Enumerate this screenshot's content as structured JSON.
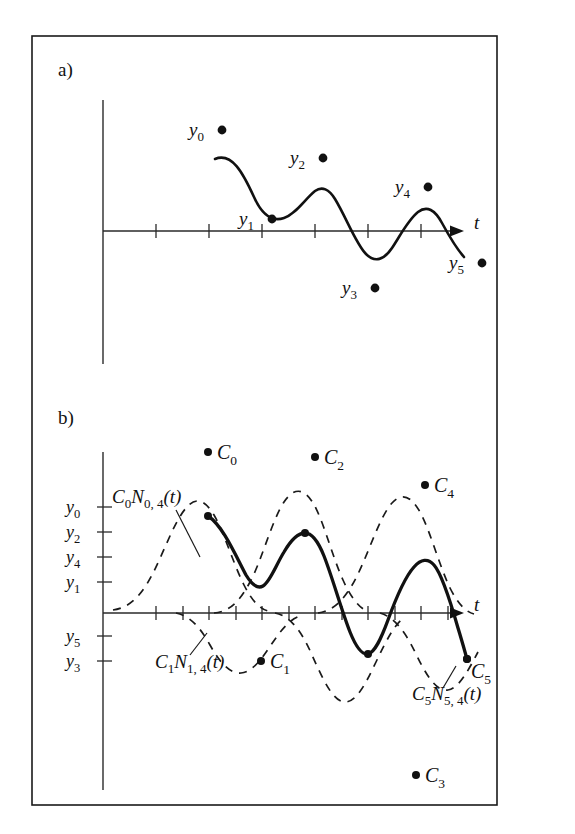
{
  "figure": {
    "background_color": "#ffffff",
    "ink_color": "#111111",
    "frame": {
      "x": 32,
      "y": 36,
      "width": 465,
      "height": 769
    }
  },
  "panel_a": {
    "label": "a)",
    "axis_label_t": "t",
    "data_point_labels": [
      "y",
      "y",
      "y",
      "y",
      "y",
      "y"
    ],
    "data_point_subscripts": [
      "0",
      "1",
      "2",
      "3",
      "4",
      "5"
    ],
    "points": [
      {
        "label": "y",
        "sub": "0",
        "dot_x": 222,
        "dot_y": 130,
        "text_x": 189,
        "text_y": 136,
        "dot_side": "right"
      },
      {
        "label": "y",
        "sub": "1",
        "dot_x": 272,
        "dot_y": 219,
        "text_x": 239,
        "text_y": 225,
        "dot_side": "right"
      },
      {
        "label": "y",
        "sub": "2",
        "dot_x": 323,
        "dot_y": 158,
        "text_x": 290,
        "text_y": 164,
        "dot_side": "right"
      },
      {
        "label": "y",
        "sub": "3",
        "dot_x": 375,
        "dot_y": 288,
        "text_x": 342,
        "text_y": 294,
        "dot_side": "right"
      },
      {
        "label": "y",
        "sub": "4",
        "dot_x": 428,
        "dot_y": 187,
        "text_x": 395,
        "text_y": 193,
        "dot_side": "right"
      },
      {
        "label": "y",
        "sub": "5",
        "dot_x": 482,
        "dot_y": 263,
        "text_x": 449,
        "text_y": 269,
        "dot_side": "right"
      }
    ],
    "axis": {
      "x_origin": 103,
      "y_baseline": 231,
      "x_end": 455,
      "y_top": 100,
      "y_bottom": 364
    },
    "ticks_x": [
      156,
      209,
      262,
      315,
      368,
      421
    ],
    "curve_d": "M 215 159 C 232 152 243 173 254 197 C 262 215 272 222 284 218 C 296 214 305 199 315 191 C 322 186 329 189 335 199 C 346 217 356 244 366 254 C 375 263 384 260 392 248 C 400 236 408 220 418 212 C 427 205 435 210 442 223 C 448 234 456 248 464 257"
  },
  "panel_b": {
    "label": "b)",
    "axis_label_t": "t",
    "y_axis_labels": [
      {
        "label": "y",
        "sub": "0",
        "x": 88,
        "y": 513,
        "tick_y": 507
      },
      {
        "label": "y",
        "sub": "2",
        "x": 88,
        "y": 538,
        "tick_y": 532
      },
      {
        "label": "y",
        "sub": "4",
        "x": 88,
        "y": 563,
        "tick_y": 557
      },
      {
        "label": "y",
        "sub": "1",
        "x": 88,
        "y": 588,
        "tick_y": 582
      },
      {
        "label": "y",
        "sub": "5",
        "x": 88,
        "y": 642,
        "tick_y": 636
      },
      {
        "label": "y",
        "sub": "3",
        "x": 88,
        "y": 667,
        "tick_y": 661
      }
    ],
    "control_points": [
      {
        "label": "C",
        "sub": "0",
        "dot_x": 208,
        "dot_y": 452,
        "text_x": 216,
        "text_y": 459
      },
      {
        "label": "C",
        "sub": "2",
        "dot_x": 315,
        "dot_y": 457,
        "text_x": 323,
        "text_y": 464
      },
      {
        "label": "C",
        "sub": "4",
        "dot_x": 425,
        "dot_y": 485,
        "text_x": 433,
        "text_y": 492
      },
      {
        "label": "C",
        "sub": "1",
        "dot_x": 261,
        "dot_y": 661,
        "text_x": 269,
        "text_y": 668
      },
      {
        "label": "C",
        "sub": "5",
        "dot_x": 467,
        "dot_y": 659,
        "text_x": 473,
        "text_y": 672
      },
      {
        "label": "C",
        "sub": "3",
        "dot_x": 416,
        "dot_y": 775,
        "text_x": 424,
        "text_y": 782
      }
    ],
    "basis_labels": [
      {
        "name": "C0N04",
        "parts": {
          "c": "C",
          "csub": "0",
          "n": "N",
          "nsub": "0, 4",
          "arg": "(t)"
        },
        "text_x": 112,
        "text_y": 503,
        "leader": {
          "x1": 176,
          "y1": 510,
          "x2": 200,
          "y2": 555
        }
      },
      {
        "name": "C1N14",
        "parts": {
          "c": "C",
          "csub": "1",
          "n": "N",
          "nsub": "1, 4",
          "arg": "(t)"
        },
        "text_x": 155,
        "text_y": 668,
        "leader": {
          "x1": 198,
          "y1": 660,
          "x2": 212,
          "y2": 637
        }
      },
      {
        "name": "C5N54",
        "parts": {
          "c": "C",
          "csub": "5",
          "n": "N",
          "nsub": "5, 4",
          "arg": "(t)"
        },
        "text_x": 412,
        "text_y": 700,
        "leader": {
          "x1": 443,
          "y1": 690,
          "x2": 458,
          "y2": 666
        }
      }
    ],
    "axis": {
      "x_origin": 103,
      "y_baseline": 613,
      "x_end": 455,
      "y_top": 452,
      "y_bottom": 790
    },
    "ticks_x": [
      156,
      183,
      209,
      236,
      262,
      289,
      315,
      342,
      368,
      395,
      421,
      448
    ],
    "solid_curve_d": "M 208 516 C 222 525 234 552 246 575 C 252 585 258 589 263 586 C 270 582 276 565 284 552 C 291 540 298 533 305 533 C 312 533 318 541 324 556 C 333 579 341 609 350 632 C 356 647 362 655 368 654 C 375 652 381 639 388 620 C 396 598 404 578 414 567 C 421 559 428 558 434 565 C 442 574 450 600 458 628 C 462 641 465 652 467 659",
    "solid_curve_knot_dots": [
      {
        "x": 208,
        "y": 516
      },
      {
        "x": 305,
        "y": 533
      },
      {
        "x": 368,
        "y": 654
      },
      {
        "x": 467,
        "y": 659
      }
    ],
    "dashed_curves": [
      {
        "name": "basis-0",
        "d": "M 113 610 C 128 608 140 598 152 575 C 164 552 174 522 186 508 C 196 496 205 500 214 515 C 224 532 233 563 244 585 C 252 601 260 609 268 611"
      },
      {
        "name": "basis-1",
        "d": "M 176 613 C 190 616 200 627 210 645 C 220 663 230 674 241 673 C 252 672 261 660 271 645 C 281 630 290 619 300 616"
      },
      {
        "name": "basis-2",
        "d": "M 214 613 C 228 612 239 603 250 582 C 262 560 272 520 284 502 C 294 487 304 488 313 503 C 323 519 332 556 343 580 C 351 598 360 609 369 612"
      },
      {
        "name": "basis-3",
        "d": "M 275 613 C 290 616 301 630 312 655 C 324 682 334 703 346 702 C 357 701 366 683 376 662 C 386 641 395 623 405 617"
      },
      {
        "name": "basis-4",
        "d": "M 318 613 C 333 611 345 600 357 576 C 369 552 380 516 392 503 C 402 492 411 496 420 512 C 430 530 439 565 450 588 C 458 604 466 612 474 614"
      },
      {
        "name": "basis-5",
        "d": "M 380 613 C 394 617 405 631 416 654 C 427 677 437 692 448 690 C 459 688 468 671 478 652"
      }
    ]
  }
}
